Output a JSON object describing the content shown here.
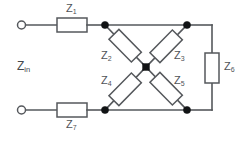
{
  "diagram": {
    "type": "circuit-schematic",
    "colors": {
      "wire": "#55585c",
      "node": "#111315",
      "label": "#4f5357",
      "background": "#ffffff"
    },
    "input_label": {
      "base": "Z",
      "sub": "in",
      "full": "Zin"
    },
    "components": [
      {
        "id": "z1",
        "base": "Z",
        "sub": "1",
        "full": "Z1",
        "kind": "resistor",
        "orientation": "horizontal",
        "position": "top-series-lead"
      },
      {
        "id": "z2",
        "base": "Z",
        "sub": "2",
        "full": "Z2",
        "kind": "resistor",
        "orientation": "diagonal-down-right",
        "position": "upper-left-arm"
      },
      {
        "id": "z3",
        "base": "Z",
        "sub": "3",
        "full": "Z3",
        "kind": "resistor",
        "orientation": "diagonal-down-left",
        "position": "upper-right-arm"
      },
      {
        "id": "z4",
        "base": "Z",
        "sub": "4",
        "full": "Z4",
        "kind": "resistor",
        "orientation": "diagonal-up-right",
        "position": "lower-left-arm"
      },
      {
        "id": "z5",
        "base": "Z",
        "sub": "5",
        "full": "Z5",
        "kind": "resistor",
        "orientation": "diagonal-up-left",
        "position": "lower-right-arm"
      },
      {
        "id": "z6",
        "base": "Z",
        "sub": "6",
        "full": "Z6",
        "kind": "resistor",
        "orientation": "vertical",
        "position": "right-shunt"
      },
      {
        "id": "z7",
        "base": "Z",
        "sub": "7",
        "full": "Z7",
        "kind": "resistor",
        "orientation": "horizontal",
        "position": "bottom-series-lead"
      }
    ],
    "terminals": [
      {
        "id": "terminal-top",
        "position": "left-top",
        "style": "open-circle"
      },
      {
        "id": "terminal-bottom",
        "position": "left-bottom",
        "style": "open-circle"
      }
    ],
    "nodes": [
      {
        "id": "node-upper-left",
        "x": 105,
        "y": 25
      },
      {
        "id": "node-upper-right",
        "x": 187,
        "y": 25
      },
      {
        "id": "node-center",
        "x": 146,
        "y": 67
      },
      {
        "id": "node-lower-left",
        "x": 105,
        "y": 110
      },
      {
        "id": "node-lower-right",
        "x": 187,
        "y": 110
      }
    ]
  }
}
